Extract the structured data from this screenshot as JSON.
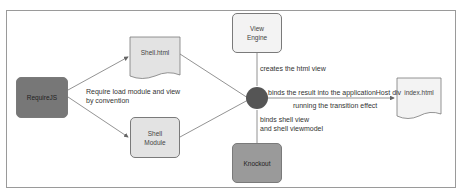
{
  "nodes": {
    "requirejs": {
      "label": "RequireJS",
      "color": "#777777"
    },
    "shell_html": {
      "label": "Shell.html",
      "color": "#e3e3e3"
    },
    "shell_module": {
      "label_line1": "Shell",
      "label_line2": "Module",
      "color": "#e3e3e3"
    },
    "view_engine": {
      "label_line1": "View",
      "label_line2": "Engine",
      "color": "#f3f3f3"
    },
    "knockout": {
      "label": "Knockout",
      "color": "#9a9a9a"
    },
    "index_html": {
      "label": "index.html",
      "color": "#f3f3f3"
    },
    "hub": {
      "color": "#555555"
    }
  },
  "edges": {
    "require_label_line1": "Require load module and view",
    "require_label_line2": "by convention",
    "view_engine_label": "creates the html view",
    "binds_result_label": "binds the result into the applicationHost div",
    "transition_label": "running the transition effect",
    "knockout_label_line1": "binds shell view",
    "knockout_label_line2": "and shell viewmodel"
  }
}
